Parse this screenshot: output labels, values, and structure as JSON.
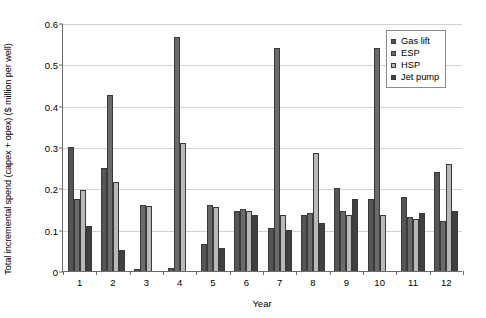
{
  "chart_data": {
    "type": "bar",
    "title": "",
    "xlabel": "Year",
    "ylabel": "Total incremental spend (capex + opex) ($ million per well)",
    "categories": [
      "1",
      "2",
      "3",
      "4",
      "5",
      "6",
      "7",
      "8",
      "9",
      "10",
      "11",
      "12"
    ],
    "ylim": [
      0,
      0.6
    ],
    "ytick_labels": [
      "0",
      "0.1",
      "0.2",
      "0.3",
      "0.4",
      "0.5",
      "0.6"
    ],
    "ytick_values": [
      0,
      0.1,
      0.2,
      0.3,
      0.4,
      0.5,
      0.6
    ],
    "grid": true,
    "legend_position": "top-right",
    "series": [
      {
        "name": "Gas lift",
        "color": "#555555",
        "values": [
          0.3,
          0.25,
          0.005,
          0.008,
          0.065,
          0.145,
          0.105,
          0.135,
          0.2,
          0.175,
          0.18,
          0.24
        ]
      },
      {
        "name": "ESP",
        "color": "#6a6a6a",
        "values": [
          0.175,
          0.425,
          0.16,
          0.565,
          0.16,
          0.15,
          0.54,
          0.14,
          0.145,
          0.54,
          0.13,
          0.12
        ]
      },
      {
        "name": "HSP",
        "color": "#b8b8b8",
        "values": [
          0.195,
          0.215,
          0.158,
          0.31,
          0.155,
          0.145,
          0.135,
          0.285,
          0.135,
          0.135,
          0.125,
          0.26
        ]
      },
      {
        "name": "Jet pump",
        "color": "#404040",
        "values": [
          0.11,
          0.05,
          0.0,
          0.0,
          0.055,
          0.135,
          0.1,
          0.115,
          0.175,
          0.0,
          0.14,
          0.145
        ]
      }
    ]
  },
  "legend": {
    "items": [
      {
        "label": "Gas lift",
        "color": "#555555"
      },
      {
        "label": "ESP",
        "color": "#6a6a6a"
      },
      {
        "label": "HSP",
        "color": "#b8b8b8"
      },
      {
        "label": "Jet pump",
        "color": "#404040"
      }
    ]
  }
}
